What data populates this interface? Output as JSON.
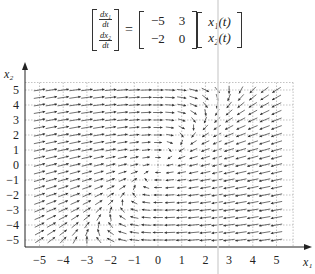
{
  "equation": {
    "lhs": [
      {
        "num": "dx₁",
        "den": "dt"
      },
      {
        "num": "dx₂",
        "den": "dt"
      }
    ],
    "equals": "=",
    "matrix": [
      [
        "−5",
        "3"
      ],
      [
        "−2",
        "0"
      ]
    ],
    "matrix_values": [
      [
        -5,
        3
      ],
      [
        -2,
        0
      ]
    ],
    "state_vector": [
      "x₁(t)",
      "x₂(t)"
    ]
  },
  "chart_data": {
    "type": "vector_field",
    "xlabel": "x₁",
    "ylabel": "x₂",
    "xlim": [
      -5.7,
      5.7
    ],
    "ylim": [
      -5.5,
      5.5
    ],
    "x_ticks": [
      -5,
      -4,
      -3,
      -2,
      -1,
      0,
      1,
      2,
      3,
      4,
      5
    ],
    "y_ticks": [
      -5,
      -4,
      -3,
      -2,
      -1,
      0,
      1,
      2,
      3,
      4,
      5
    ],
    "x_tick_labels": [
      "−5",
      "−4",
      "−3",
      "−2",
      "−1",
      "0",
      "1",
      "2",
      "3",
      "4",
      "5"
    ],
    "y_tick_labels": [
      "−5",
      "−4",
      "−3",
      "−2",
      "−1",
      "0",
      "1",
      "2",
      "3",
      "4",
      "5"
    ],
    "grid": true,
    "grid_style": "dashed",
    "arrow_sample_step": 0.5,
    "arrow_range": [
      -5,
      5
    ],
    "field": {
      "dx1": "-5*x1 + 3*x2",
      "dx2": "-2*x1"
    }
  },
  "colors": {
    "axis": "#222222",
    "grid": "#9a9a9a",
    "arrow": "#333333",
    "text": "#222222"
  }
}
